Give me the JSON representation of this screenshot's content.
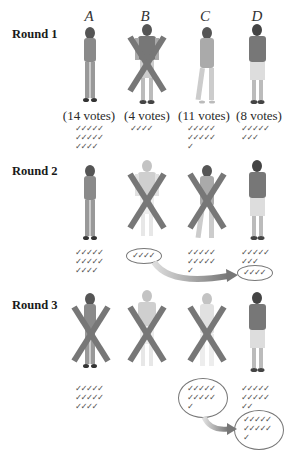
{
  "candidates": [
    {
      "letter": "A",
      "round1_votes": 14
    },
    {
      "letter": "B",
      "round1_votes": 4
    },
    {
      "letter": "C",
      "round1_votes": 11
    },
    {
      "letter": "D",
      "round1_votes": 8
    }
  ],
  "labels": {
    "col_a": "A",
    "col_b": "B",
    "col_c": "C",
    "col_d": "D",
    "round1": "Round 1",
    "round2": "Round 2",
    "round3": "Round 3",
    "votes_a": "(14 votes)",
    "votes_b": "(4 votes)",
    "votes_c": "(11 votes)",
    "votes_d": "(8 votes)"
  },
  "checks": {
    "r1_a": "✓✓✓✓✓\n✓✓✓✓✓\n✓✓✓✓",
    "r1_b": "✓✓✓✓",
    "r1_c": "✓✓✓✓✓\n✓✓✓✓✓\n✓",
    "r1_d": "✓✓✓✓✓\n✓✓✓",
    "r2_a": "✓✓✓✓✓\n✓✓✓✓✓\n✓✓✓✓",
    "r2_b_circled": "✓✓✓✓",
    "r2_c": "✓✓✓✓✓\n✓✓✓✓✓\n✓",
    "r2_d": "✓✓✓✓✓\n✓✓✓",
    "r2_d_transferred": "✓✓✓✓",
    "r3_a": "✓✓✓✓✓\n✓✓✓✓✓\n✓✓✓✓",
    "r3_c_circled": "✓✓✓✓✓\n✓✓✓✓✓\n✓",
    "r3_d": "✓✓✓✓✓\n✓✓✓✓✓\n✓✓",
    "r3_d_transferred": "✓✓✓✓✓\n✓✓✓✓✓\n✓"
  },
  "rounds": [
    {
      "label": "Round 1",
      "eliminated": [
        "B"
      ],
      "votes": {
        "A": 14,
        "B": 4,
        "C": 11,
        "D": 8
      }
    },
    {
      "label": "Round 2",
      "eliminated": [
        "B",
        "C"
      ],
      "transfer": {
        "from": "B",
        "to": "D",
        "count": 4
      },
      "votes": {
        "A": 14,
        "C": 11,
        "D": 12
      }
    },
    {
      "label": "Round 3",
      "eliminated": [
        "A",
        "B",
        "C"
      ],
      "transfer": {
        "from": "C",
        "to": "D",
        "count": 11
      },
      "votes": {
        "A": 14,
        "D": 23
      }
    }
  ],
  "colors": {
    "x_mark": "#7a7a7a",
    "arrow": "#8c8c8c",
    "check": "#555555"
  }
}
